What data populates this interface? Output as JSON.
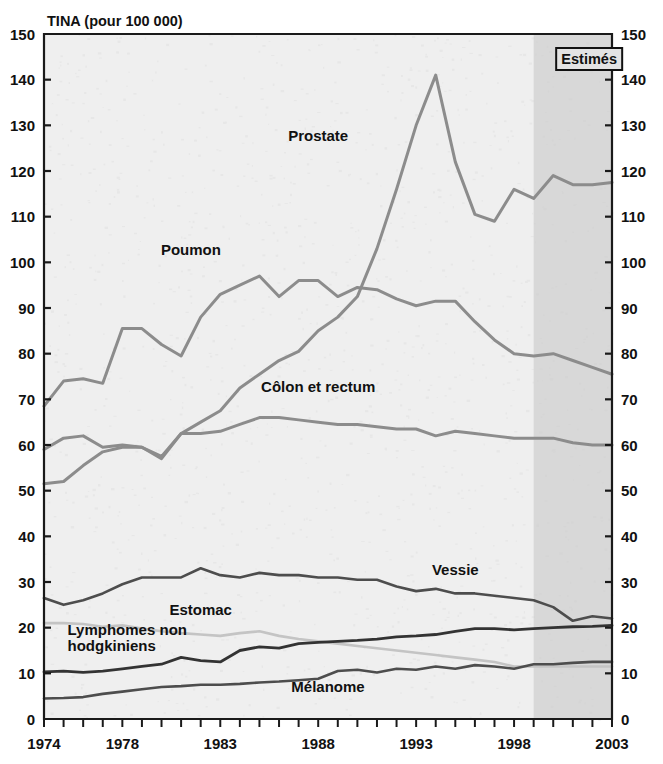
{
  "chart_data": {
    "type": "line",
    "title": "",
    "ylabel": "TINA (pour 100 000)",
    "xlabel": "",
    "ylim": [
      0,
      150
    ],
    "ytick_step": 10,
    "xlim": [
      1974,
      2003
    ],
    "grid": false,
    "legend_position": "inline-labels",
    "dual_y_axis": true,
    "annotation": {
      "label": "Estimés",
      "start_year": 1999,
      "end_year": 2003,
      "shaded": true,
      "shade_color": "#c9c9c9"
    },
    "yticks": [
      0,
      10,
      20,
      30,
      40,
      50,
      60,
      70,
      80,
      90,
      100,
      110,
      120,
      130,
      140,
      150
    ],
    "xticks_labeled": [
      1974,
      1978,
      1983,
      1988,
      1993,
      1998,
      2003
    ],
    "x": [
      1974,
      1975,
      1976,
      1977,
      1978,
      1979,
      1980,
      1981,
      1982,
      1983,
      1984,
      1985,
      1986,
      1987,
      1988,
      1989,
      1990,
      1991,
      1992,
      1993,
      1994,
      1995,
      1996,
      1997,
      1998,
      1999,
      2000,
      2001,
      2002,
      2003
    ],
    "series": [
      {
        "name": "Prostate",
        "color": "#8c8c8c",
        "width": 3.0,
        "label_x": 1988.0,
        "label_y": 126.5,
        "values": [
          59,
          61.5,
          62,
          59.5,
          60,
          59.5,
          57,
          62.5,
          65,
          67.5,
          72.5,
          75.5,
          78.5,
          80.5,
          85,
          88,
          92.5,
          103,
          116,
          130,
          141,
          122,
          110.5,
          109,
          116,
          114,
          119,
          117,
          117,
          117.5
        ]
      },
      {
        "name": "Poumon",
        "color": "#8c8c8c",
        "width": 3.0,
        "label_x": 1981.5,
        "label_y": 101.5,
        "values": [
          68.5,
          74,
          74.5,
          73.5,
          85.5,
          85.5,
          82,
          79.5,
          88,
          93,
          95,
          97,
          92.5,
          96,
          96,
          92.5,
          94.5,
          94,
          92,
          90.5,
          91.5,
          91.5,
          87,
          83,
          80,
          79.5,
          80,
          78.5,
          77,
          75.5
        ]
      },
      {
        "name": "Côlon et rectum",
        "color": "#8c8c8c",
        "width": 3.0,
        "label_x": 1988.0,
        "label_y": 71.5,
        "values": [
          51.5,
          52,
          55.5,
          58.5,
          59.5,
          59.5,
          57.5,
          62.5,
          62.5,
          63,
          64.5,
          66,
          66,
          65.5,
          65,
          64.5,
          64.5,
          64,
          63.5,
          63.5,
          62,
          63,
          62.5,
          62,
          61.5,
          61.5,
          61.5,
          60.5,
          60,
          60
        ]
      },
      {
        "name": "Vessie",
        "color": "#4d4d4d",
        "width": 2.6,
        "label_x": 1995.0,
        "label_y": 31.5,
        "values": [
          26.5,
          25,
          26,
          27.5,
          29.5,
          31,
          31,
          31,
          33,
          31.5,
          31,
          32,
          31.5,
          31.5,
          31,
          31,
          30.5,
          30.5,
          29,
          28,
          28.5,
          27.5,
          27.5,
          27,
          26.5,
          26,
          24.5,
          21.5,
          22.5,
          22
        ]
      },
      {
        "name": "Estomac",
        "color": "#c4c4c4",
        "width": 2.6,
        "label_x": 1982.0,
        "label_y": 22.8,
        "values": [
          21,
          21,
          20.8,
          20.2,
          20.5,
          19.8,
          19.2,
          18.8,
          18.5,
          18.2,
          18.8,
          19.2,
          18.2,
          17.5,
          17,
          16.5,
          16,
          15.5,
          15,
          14.5,
          14,
          13.5,
          13,
          12.5,
          11.5,
          11.5,
          11.5,
          11.5,
          11.5,
          11.5
        ]
      },
      {
        "name": "Lymphomes non hodgkiniens",
        "color": "#333333",
        "width": 2.8,
        "label_x": 1975.2,
        "label_y": 18.5,
        "label_line2_y": 15.0,
        "values": [
          10.3,
          10.5,
          10.2,
          10.5,
          11,
          11.5,
          12,
          13.5,
          12.8,
          12.5,
          15,
          15.8,
          15.5,
          16.5,
          16.8,
          17,
          17.2,
          17.5,
          18,
          18.2,
          18.5,
          19.2,
          19.8,
          19.8,
          19.5,
          19.8,
          20,
          20.2,
          20.3,
          20.5
        ]
      },
      {
        "name": "Mélanome",
        "color": "#4d4d4d",
        "width": 2.6,
        "label_x": 1988.5,
        "label_y": 6.0,
        "values": [
          4.5,
          4.6,
          4.8,
          5.5,
          6,
          6.5,
          7,
          7.2,
          7.5,
          7.5,
          7.7,
          8,
          8.2,
          8.5,
          8.8,
          10.5,
          10.8,
          10.2,
          11,
          10.8,
          11.5,
          11,
          11.8,
          11.5,
          11,
          12,
          12,
          12.3,
          12.5,
          12.5
        ]
      }
    ]
  },
  "plot": {
    "bg_color": "#efefef",
    "frame_color": "#1a1a1a",
    "left": 44,
    "right": 612,
    "top": 34,
    "bottom": 719
  }
}
